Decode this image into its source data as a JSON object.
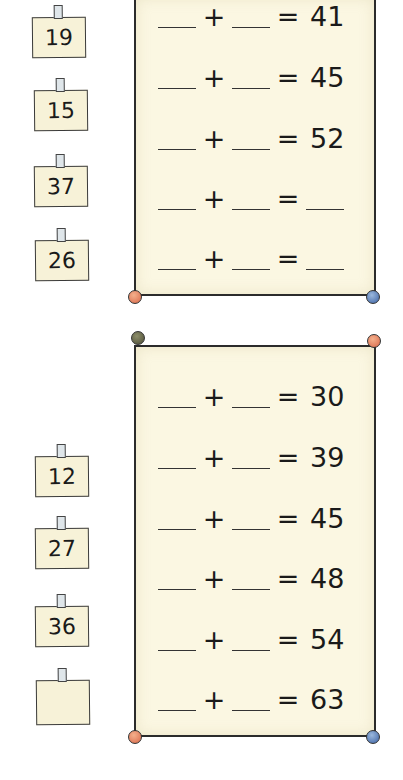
{
  "exercise_1": {
    "notes": [
      "19",
      "15",
      "37",
      "26"
    ],
    "equations": [
      {
        "addend1": "",
        "addend2": "",
        "result": "41"
      },
      {
        "addend1": "",
        "addend2": "",
        "result": "45"
      },
      {
        "addend1": "",
        "addend2": "",
        "result": "52"
      },
      {
        "addend1": "",
        "addend2": "",
        "result": ""
      },
      {
        "addend1": "",
        "addend2": "",
        "result": ""
      }
    ],
    "pins": {
      "bottom_left": "red-pin",
      "bottom_right": "blue-pin"
    }
  },
  "exercise_2": {
    "notes": [
      "12",
      "27",
      "36",
      ""
    ],
    "equations": [
      {
        "addend1": "",
        "addend2": "",
        "result": "30"
      },
      {
        "addend1": "",
        "addend2": "",
        "result": "39"
      },
      {
        "addend1": "",
        "addend2": "",
        "result": "45"
      },
      {
        "addend1": "",
        "addend2": "",
        "result": "48"
      },
      {
        "addend1": "",
        "addend2": "",
        "result": "54"
      },
      {
        "addend1": "",
        "addend2": "",
        "result": "63"
      }
    ],
    "pins": {
      "top_left": "olive-pin",
      "top_right": "red-pin",
      "bottom_left": "red-pin",
      "bottom_right": "blue-pin"
    }
  },
  "symbols": {
    "plus": "+",
    "equals": "="
  },
  "colors": {
    "paper": "#fbf7e2",
    "note": "#f7f2d8",
    "ink": "#1a1a1a",
    "pin_red": "#d9694a",
    "pin_blue": "#3d63a4",
    "pin_olive": "#4d4d36"
  }
}
